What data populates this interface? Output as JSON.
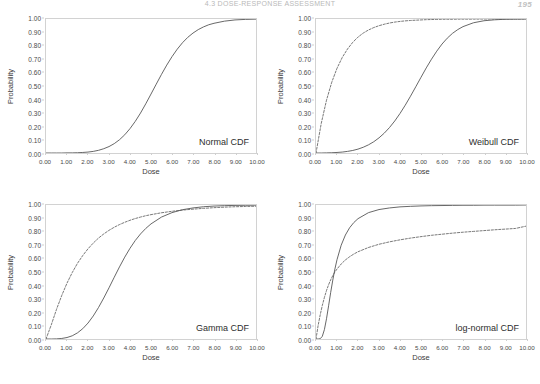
{
  "document": {
    "running_head": "4.3  DOSE-RESPONSE ASSESSMENT",
    "page_number": "195"
  },
  "common": {
    "xlabel": "Dose",
    "ylabel": "Probability",
    "xticks": [
      "0.00",
      "1.00",
      "2.00",
      "3.00",
      "4.00",
      "5.00",
      "6.00",
      "7.00",
      "8.00",
      "9.00",
      "10.00"
    ],
    "yticks": [
      "0.00",
      "0.10",
      "0.20",
      "0.30",
      "0.40",
      "0.50",
      "0.60",
      "0.70",
      "0.80",
      "0.90",
      "1.00"
    ],
    "xlim": [
      0,
      10
    ],
    "ylim": [
      0,
      1
    ],
    "grid": false,
    "legend": "none"
  },
  "chart_data": [
    {
      "type": "line",
      "panel": "top-left",
      "title": "Normal CDF",
      "xlabel": "Dose",
      "ylabel": "Probability",
      "xlim": [
        0,
        10
      ],
      "ylim": [
        0,
        1
      ],
      "grid": false,
      "x": [
        0,
        0.25,
        0.5,
        0.75,
        1,
        1.25,
        1.5,
        1.75,
        2,
        2.25,
        2.5,
        2.75,
        3,
        3.25,
        3.5,
        3.75,
        4,
        4.25,
        4.5,
        4.75,
        5,
        5.25,
        5.5,
        5.75,
        6,
        6.25,
        6.5,
        6.75,
        7,
        7.25,
        7.5,
        7.75,
        8,
        8.5,
        9,
        9.5,
        10
      ],
      "series": [
        {
          "name": "Normal CDF",
          "style": "solid",
          "values": [
            0.0,
            0.0,
            0.0,
            0.0,
            0.001,
            0.001,
            0.002,
            0.004,
            0.007,
            0.012,
            0.02,
            0.032,
            0.048,
            0.07,
            0.099,
            0.136,
            0.182,
            0.236,
            0.298,
            0.367,
            0.44,
            0.514,
            0.587,
            0.656,
            0.719,
            0.775,
            0.823,
            0.863,
            0.895,
            0.921,
            0.941,
            0.957,
            0.968,
            0.984,
            0.993,
            0.997,
            0.999
          ]
        }
      ]
    },
    {
      "type": "line",
      "panel": "top-right",
      "title": "Weibull CDF",
      "xlabel": "Dose",
      "ylabel": "Probability",
      "xlim": [
        0,
        10
      ],
      "ylim": [
        0,
        1
      ],
      "grid": false,
      "x": [
        0,
        0.25,
        0.5,
        0.75,
        1,
        1.25,
        1.5,
        1.75,
        2,
        2.25,
        2.5,
        2.75,
        3,
        3.25,
        3.5,
        3.75,
        4,
        4.25,
        4.5,
        4.75,
        5,
        5.25,
        5.5,
        5.75,
        6,
        6.25,
        6.5,
        6.75,
        7,
        7.5,
        8,
        8.5,
        9,
        9.5,
        10
      ],
      "series": [
        {
          "name": "Weibull CDF (dashed)",
          "style": "dashed",
          "values": [
            0.0,
            0.221,
            0.394,
            0.528,
            0.632,
            0.713,
            0.776,
            0.826,
            0.865,
            0.895,
            0.918,
            0.936,
            0.95,
            0.961,
            0.97,
            0.977,
            0.982,
            0.986,
            0.989,
            0.991,
            0.993,
            0.995,
            0.996,
            0.997,
            0.998,
            0.998,
            0.998,
            0.999,
            0.999,
            0.999,
            1.0,
            1.0,
            1.0,
            1.0,
            1.0
          ]
        },
        {
          "name": "Weibull CDF (solid)",
          "style": "solid",
          "values": [
            0.0,
            0.0,
            0.001,
            0.002,
            0.004,
            0.007,
            0.012,
            0.019,
            0.029,
            0.043,
            0.061,
            0.084,
            0.113,
            0.148,
            0.19,
            0.239,
            0.295,
            0.357,
            0.424,
            0.494,
            0.565,
            0.635,
            0.7,
            0.76,
            0.813,
            0.857,
            0.893,
            0.921,
            0.943,
            0.972,
            0.987,
            0.994,
            0.998,
            0.999,
            1.0
          ]
        }
      ]
    },
    {
      "type": "line",
      "panel": "bottom-left",
      "title": "Gamma CDF",
      "xlabel": "Dose",
      "ylabel": "Probability",
      "xlim": [
        0,
        10
      ],
      "ylim": [
        0,
        1
      ],
      "grid": false,
      "x": [
        0,
        0.25,
        0.5,
        0.75,
        1,
        1.25,
        1.5,
        1.75,
        2,
        2.25,
        2.5,
        2.75,
        3,
        3.25,
        3.5,
        3.75,
        4,
        4.25,
        4.5,
        4.75,
        5,
        5.5,
        6,
        6.5,
        7,
        7.5,
        8,
        8.5,
        9,
        9.5,
        10
      ],
      "series": [
        {
          "name": "Gamma CDF (dashed)",
          "style": "dashed",
          "values": [
            0.0,
            0.105,
            0.221,
            0.325,
            0.417,
            0.496,
            0.565,
            0.623,
            0.673,
            0.716,
            0.753,
            0.784,
            0.811,
            0.834,
            0.854,
            0.871,
            0.886,
            0.899,
            0.91,
            0.92,
            0.928,
            0.942,
            0.953,
            0.962,
            0.969,
            0.975,
            0.98,
            0.984,
            0.987,
            0.989,
            0.991
          ]
        },
        {
          "name": "Gamma CDF (solid)",
          "style": "solid",
          "values": [
            0.0,
            0.0,
            0.001,
            0.004,
            0.011,
            0.024,
            0.046,
            0.077,
            0.119,
            0.172,
            0.235,
            0.306,
            0.382,
            0.461,
            0.538,
            0.611,
            0.677,
            0.735,
            0.784,
            0.825,
            0.859,
            0.91,
            0.943,
            0.965,
            0.978,
            0.987,
            0.992,
            0.995,
            0.997,
            0.998,
            0.999
          ]
        }
      ]
    },
    {
      "type": "line",
      "panel": "bottom-right",
      "title": "log-normal CDF",
      "xlabel": "Dose",
      "ylabel": "Probability",
      "xlim": [
        0,
        10
      ],
      "ylim": [
        0,
        1
      ],
      "grid": false,
      "x": [
        0,
        0.1,
        0.2,
        0.3,
        0.4,
        0.5,
        0.6,
        0.7,
        0.8,
        0.9,
        1,
        1.2,
        1.4,
        1.6,
        1.8,
        2,
        2.5,
        3,
        3.5,
        4,
        4.5,
        5,
        5.5,
        6,
        6.5,
        7,
        7.5,
        8,
        8.5,
        9,
        9.5,
        10
      ],
      "series": [
        {
          "name": "log-normal CDF (solid)",
          "style": "solid",
          "values": [
            0.0,
            0.0,
            0.002,
            0.02,
            0.07,
            0.151,
            0.248,
            0.348,
            0.44,
            0.522,
            0.592,
            0.7,
            0.776,
            0.83,
            0.869,
            0.898,
            0.943,
            0.966,
            0.978,
            0.986,
            0.99,
            0.993,
            0.995,
            0.996,
            0.997,
            0.998,
            0.998,
            0.999,
            0.999,
            0.999,
            0.999,
            1.0
          ]
        },
        {
          "name": "log-normal CDF (dashed)",
          "style": "dashed",
          "values": [
            0.0,
            0.1,
            0.18,
            0.25,
            0.31,
            0.362,
            0.405,
            0.442,
            0.473,
            0.5,
            0.522,
            0.56,
            0.59,
            0.614,
            0.634,
            0.651,
            0.683,
            0.707,
            0.725,
            0.74,
            0.753,
            0.764,
            0.774,
            0.782,
            0.79,
            0.797,
            0.803,
            0.809,
            0.815,
            0.82,
            0.825,
            0.842
          ]
        }
      ]
    }
  ]
}
